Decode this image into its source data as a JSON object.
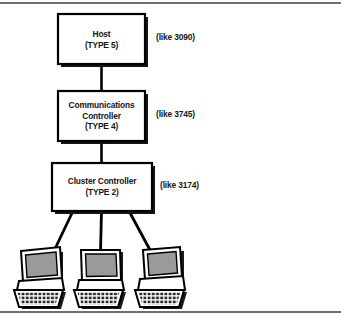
{
  "figure": {
    "background_color": "#ffffff",
    "line_color": "#000000",
    "rule_color": "#6f6f6f"
  },
  "nodes": [
    {
      "id": "host",
      "name": "Host",
      "type_line": "(TYPE 5)",
      "annotation": "(like 3090)"
    },
    {
      "id": "comm-controller",
      "name_line1": "Communications",
      "name_line2": "Controller",
      "type_line": "(TYPE 4)",
      "annotation": "(like 3745)"
    },
    {
      "id": "cluster-controller",
      "name": "Cluster Controller",
      "type_line": "(TYPE 2)",
      "annotation": "(like 3174)"
    }
  ],
  "terminals": [
    {
      "id": "terminal-left",
      "label": "terminal"
    },
    {
      "id": "terminal-center",
      "label": "terminal"
    },
    {
      "id": "terminal-right",
      "label": "terminal"
    }
  ],
  "colors": {
    "screen_fill": "#9a9a9a",
    "case_fill": "#ffffff",
    "shadow_fill": "#1a1a1a",
    "keyboard_fill": "#f2f2f2",
    "key_fill": "#2b2b2b"
  }
}
